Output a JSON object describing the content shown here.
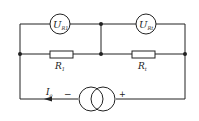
{
  "diagram": {
    "type": "circuit",
    "voltmeters": [
      {
        "id": "vm1",
        "main": "U",
        "sub": "R1"
      },
      {
        "id": "vm2",
        "main": "U",
        "sub": "Rt"
      }
    ],
    "resistors": [
      {
        "id": "r1",
        "main": "R",
        "sub": "1"
      },
      {
        "id": "rt",
        "main": "R",
        "sub": "t"
      }
    ],
    "current_source": {
      "label_main": "I",
      "label_sub": "o",
      "minus": "−",
      "plus": "+"
    },
    "colors": {
      "line": "#222222",
      "background": "#ffffff"
    }
  }
}
